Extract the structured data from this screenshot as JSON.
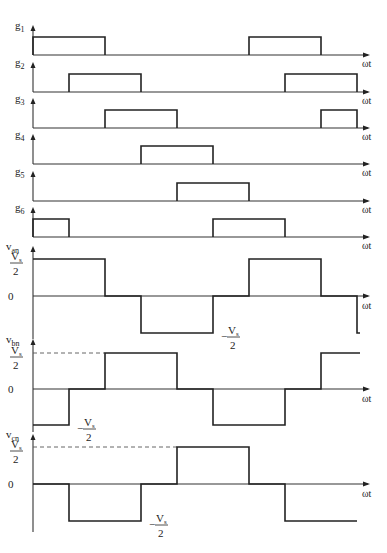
{
  "x_axis_label": "ωt",
  "degrees_per_period": 360,
  "visible_range_deg": [
    0,
    540
  ],
  "gating_signals": [
    {
      "name": "g1",
      "sub": "1",
      "high_intervals_deg": [
        [
          0,
          120
        ],
        [
          360,
          480
        ]
      ]
    },
    {
      "name": "g2",
      "sub": "2",
      "high_intervals_deg": [
        [
          60,
          180
        ],
        [
          420,
          540
        ]
      ]
    },
    {
      "name": "g3",
      "sub": "3",
      "high_intervals_deg": [
        [
          120,
          240
        ],
        [
          480,
          540
        ]
      ]
    },
    {
      "name": "g4",
      "sub": "4",
      "high_intervals_deg": [
        [
          180,
          300
        ]
      ]
    },
    {
      "name": "g5",
      "sub": "5",
      "high_intervals_deg": [
        [
          240,
          360
        ]
      ]
    },
    {
      "name": "g6",
      "sub": "6",
      "high_intervals_deg": [
        [
          0,
          60
        ],
        [
          300,
          420
        ]
      ]
    }
  ],
  "phase_voltages": [
    {
      "name": "v",
      "sub": "an",
      "levels": [
        [
          0,
          120,
          1
        ],
        [
          120,
          180,
          0
        ],
        [
          180,
          300,
          -1
        ],
        [
          300,
          360,
          0
        ],
        [
          360,
          480,
          1
        ],
        [
          480,
          540,
          0
        ],
        [
          540,
          545,
          -1
        ]
      ],
      "neg_label_at_deg": 300,
      "dashed_ref": false
    },
    {
      "name": "v",
      "sub": "bn",
      "levels": [
        [
          0,
          60,
          -1
        ],
        [
          60,
          120,
          0
        ],
        [
          120,
          240,
          1
        ],
        [
          240,
          300,
          0
        ],
        [
          300,
          420,
          -1
        ],
        [
          420,
          480,
          0
        ],
        [
          480,
          545,
          1
        ]
      ],
      "neg_label_at_deg": 60,
      "dashed_ref": true
    },
    {
      "name": "v",
      "sub": "cn",
      "levels": [
        [
          0,
          60,
          0
        ],
        [
          60,
          180,
          -1
        ],
        [
          180,
          240,
          0
        ],
        [
          240,
          360,
          1
        ],
        [
          360,
          420,
          0
        ],
        [
          420,
          540,
          -1
        ]
      ],
      "neg_label_at_deg": 180,
      "dashed_ref": true
    }
  ],
  "level_labels": {
    "pos_num": "V",
    "pos_sub": "s",
    "den": "2",
    "zero": "0",
    "minus": "−"
  }
}
